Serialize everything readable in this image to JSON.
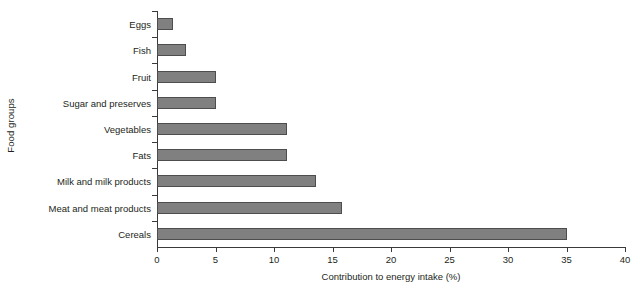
{
  "chart_data": {
    "type": "bar",
    "orientation": "horizontal",
    "title": "",
    "xlabel": "Contribution to energy intake (%)",
    "ylabel": "Food groups",
    "categories": [
      "Eggs",
      "Fish",
      "Fruit",
      "Sugar and preserves",
      "Vegetables",
      "Fats",
      "Milk and milk products",
      "Meat and meat products",
      "Cereals"
    ],
    "values": [
      1.4,
      2.5,
      5.0,
      5.0,
      11.1,
      11.1,
      13.6,
      15.8,
      35.0
    ],
    "xlim": [
      0,
      40
    ],
    "xticks": [
      0,
      5,
      10,
      15,
      20,
      25,
      30,
      35,
      40
    ],
    "xticklabels": [
      "0",
      "5",
      "10",
      "15",
      "20",
      "25",
      "30",
      "35",
      "40"
    ],
    "grid": false,
    "legend": false,
    "bar_color": "#808080",
    "bar_edge_color": "#4d4d4d",
    "axis_color": "#3a3a3a"
  }
}
